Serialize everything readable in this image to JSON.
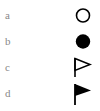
{
  "items": [
    {
      "label": "a",
      "icon": "open-circle-icon"
    },
    {
      "label": "b",
      "icon": "filled-circle-icon"
    },
    {
      "label": "c",
      "icon": "open-flag-icon"
    },
    {
      "label": "d",
      "icon": "filled-flag-icon"
    }
  ],
  "colors": {
    "label": "#888888",
    "symbol": "#000000",
    "background": "#ffffff"
  }
}
